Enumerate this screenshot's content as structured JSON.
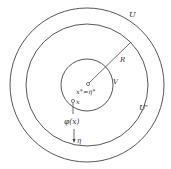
{
  "diagram": {
    "circles": [
      {
        "id": "outer",
        "label": "U",
        "cx": 87,
        "cy": 85,
        "r": 77
      },
      {
        "id": "middle",
        "label": "U'",
        "cx": 87,
        "cy": 85,
        "r": 61
      },
      {
        "id": "inner",
        "label": "V",
        "cx": 87,
        "cy": 85,
        "r": 26
      }
    ],
    "labels": {
      "U": "U",
      "U_prime": "U'",
      "V": "V",
      "R": "R",
      "center": "x°=η°",
      "x": "x",
      "phi": "φ(x)",
      "eta": "η"
    },
    "stroke_color": "#444444"
  }
}
